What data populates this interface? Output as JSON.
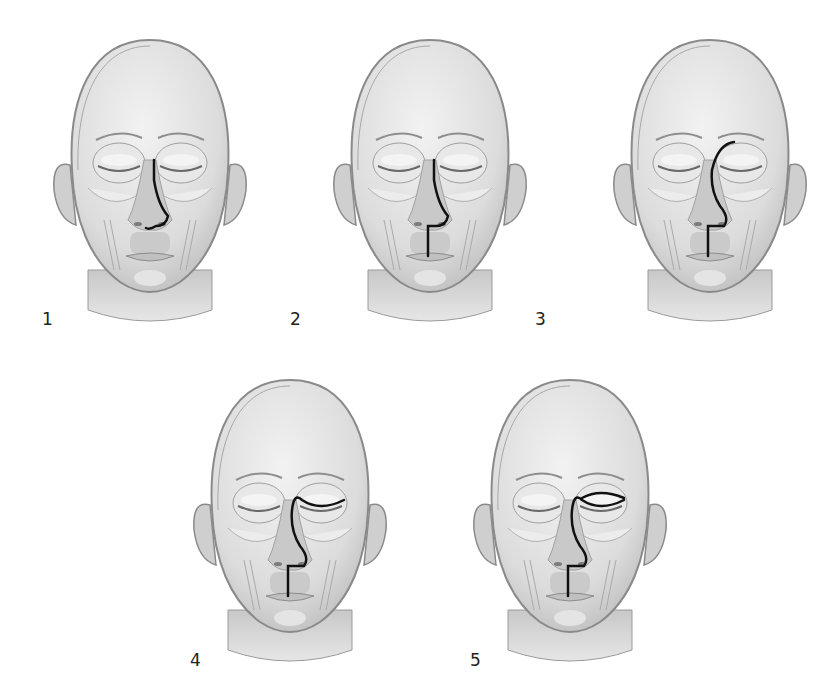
{
  "figure": {
    "panels": [
      {
        "label": "1",
        "incision": "lateral-nasal"
      },
      {
        "label": "2",
        "incision": "lateral-nasal-with-lip-split"
      },
      {
        "label": "3",
        "incision": "weber-ferguson"
      },
      {
        "label": "4",
        "incision": "weber-ferguson-with-subciliary-extension"
      },
      {
        "label": "5",
        "incision": "weber-ferguson-with-subciliary-and-supraciliary-extension"
      }
    ]
  },
  "colors": {
    "skin": "#d9d9d9",
    "skin_light": "#ececec",
    "outline": "#8a8a8a",
    "incision": "#111111",
    "label": "#222222"
  }
}
